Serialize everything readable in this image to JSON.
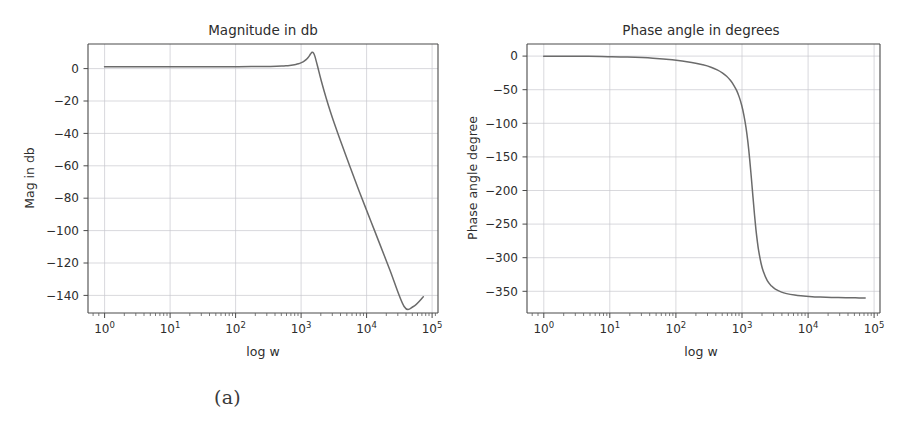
{
  "figure": {
    "caption_a": "(a)",
    "caption_b": "(b)",
    "background_color": "#ffffff",
    "curve_color": "#6b6b6b",
    "grid_color": "#c9c9cf",
    "axis_color": "#4a4a4a"
  },
  "chart_data": [
    {
      "type": "line",
      "id": "magnitude-bode",
      "title": "Magnitude in db",
      "xlabel": "log w",
      "ylabel": "Mag in db",
      "xscale": "log",
      "yscale": "linear",
      "grid": true,
      "legend": "none",
      "xlim": [
        0.55,
        170000
      ],
      "ylim": [
        -152,
        14
      ],
      "xticks": [
        1,
        10,
        100,
        1000,
        10000,
        100000
      ],
      "xtick_labels": [
        "10^0",
        "10^1",
        "10^2",
        "10^3",
        "10^4",
        "10^5"
      ],
      "xtick_bases": [
        "10",
        "10",
        "10",
        "10",
        "10",
        "10"
      ],
      "xtick_exponents": [
        "0",
        "1",
        "2",
        "3",
        "4",
        "5"
      ],
      "yticks": [
        0,
        -20,
        -40,
        -60,
        -80,
        -100,
        -120,
        -140
      ],
      "ytick_labels": [
        "0",
        "−20",
        "−40",
        "−60",
        "−80",
        "−100",
        "−120",
        "−140"
      ],
      "series": [
        {
          "name": "magnitude",
          "x": [
            1,
            2,
            5,
            10,
            20,
            50,
            100,
            200,
            300,
            400,
            500,
            600,
            700,
            800,
            900,
            1000,
            1100,
            1200,
            1300,
            1400,
            1500,
            1600,
            1700,
            1800,
            1900,
            2000,
            2200,
            2500,
            3000,
            3500,
            4000,
            5000,
            6000,
            8000,
            10000,
            15000,
            20000,
            30000,
            50000,
            70000,
            100000
          ],
          "y": [
            0.0,
            0.0,
            0.0,
            0.0,
            0.0,
            0.0,
            0.01,
            0.04,
            0.09,
            0.17,
            0.27,
            0.4,
            0.57,
            0.78,
            1.05,
            1.38,
            1.8,
            2.33,
            3.0,
            3.84,
            4.9,
            6.2,
            7.8,
            8.9,
            8.4,
            6.2,
            0.1,
            -8.5,
            -19.5,
            -28.0,
            -34.8,
            -45.5,
            -54.0,
            -67.3,
            -77.5,
            -95.2,
            -107.8,
            -125.6,
            -148.0,
            -148.0,
            -142.0
          ]
        }
      ],
      "annotations": [
        {
          "text": "resonant peak ≈ +9 dB near w ≈ 1700"
        },
        {
          "text": "final value ≈ −142 dB at w = 10^5"
        }
      ]
    },
    {
      "type": "line",
      "id": "phase-bode",
      "title": "Phase angle in degrees",
      "xlabel": "log w",
      "ylabel": "Phase angle degree",
      "xscale": "log",
      "yscale": "linear",
      "grid": true,
      "legend": "none",
      "xlim": [
        0.55,
        170000
      ],
      "ylim": [
        -382,
        18
      ],
      "xticks": [
        1,
        10,
        100,
        1000,
        10000,
        100000
      ],
      "xtick_labels": [
        "10^0",
        "10^1",
        "10^2",
        "10^3",
        "10^4",
        "10^5"
      ],
      "xtick_bases": [
        "10",
        "10",
        "10",
        "10",
        "10",
        "10"
      ],
      "xtick_exponents": [
        "0",
        "1",
        "2",
        "3",
        "4",
        "5"
      ],
      "yticks": [
        0,
        -50,
        -100,
        -150,
        -200,
        -250,
        -300,
        -350
      ],
      "ytick_labels": [
        "0",
        "−50",
        "−100",
        "−150",
        "−200",
        "−250",
        "−300",
        "−350"
      ],
      "series": [
        {
          "name": "phase",
          "x": [
            1,
            2,
            5,
            10,
            20,
            50,
            100,
            200,
            300,
            400,
            500,
            600,
            700,
            800,
            900,
            1000,
            1100,
            1200,
            1300,
            1400,
            1500,
            1600,
            1700,
            1800,
            1900,
            2000,
            2100,
            2200,
            2400,
            2600,
            3000,
            3500,
            4000,
            5000,
            6000,
            8000,
            10000,
            15000,
            20000,
            30000,
            50000,
            70000,
            100000
          ],
          "y": [
            -0.1,
            -0.2,
            -0.4,
            -0.8,
            -1.5,
            -3.2,
            -5.6,
            -9.5,
            -13.0,
            -16.5,
            -20.5,
            -25.0,
            -30.0,
            -36.0,
            -43.0,
            -51.0,
            -61.0,
            -73.0,
            -88.0,
            -106.0,
            -128.0,
            -154.0,
            -182.0,
            -210.0,
            -236.0,
            -258.0,
            -275.0,
            -289.0,
            -308.0,
            -320.0,
            -334.0,
            -342.0,
            -346.5,
            -351.0,
            -353.2,
            -355.4,
            -356.5,
            -357.7,
            -358.2,
            -358.8,
            -359.3,
            -359.5,
            -359.7
          ]
        }
      ],
      "annotations": [
        {
          "text": "starts at 0°, asymptotes to −360°"
        },
        {
          "text": "steep transition near w ≈ 1700"
        }
      ]
    }
  ]
}
